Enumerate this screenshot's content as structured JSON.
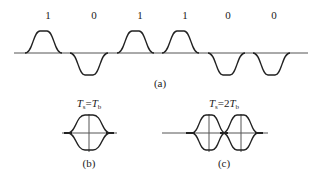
{
  "figure": {
    "panel_a": {
      "caption": "(a)",
      "bits": [
        "1",
        "0",
        "1",
        "1",
        "0",
        "0"
      ],
      "description": "Bipolar raised-cosine-like pulse train; 1 = positive pulse, 0 = negative pulse"
    },
    "panel_b": {
      "caption": "(b)",
      "condition": {
        "lhs": "T",
        "lhs_sub": "s",
        "eq": "=",
        "rhs": "T",
        "rhs_sub": "b"
      },
      "description": "Eye diagram with one eye"
    },
    "panel_c": {
      "caption": "(c)",
      "condition": {
        "lhs": "T",
        "lhs_sub": "s",
        "eq": "=2",
        "rhs": "T",
        "rhs_sub": "b"
      },
      "description": "Eye diagram with two eyes"
    },
    "colors": {
      "line": "#222222",
      "axis": "#555555",
      "background": "#ffffff"
    }
  }
}
